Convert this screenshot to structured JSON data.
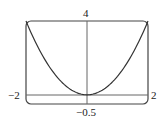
{
  "chart_data": {
    "type": "line",
    "title": "",
    "xlabel": "",
    "ylabel": "",
    "xlim": [
      -2,
      2
    ],
    "ylim": [
      -0.5,
      4
    ],
    "grid": false,
    "tick_labels": {
      "x_min": "−2",
      "x_max": "2",
      "y_min": "−0.5",
      "y_max": "4"
    },
    "series": [
      {
        "name": "y = x^2",
        "x": [
          -2,
          -1.5,
          -1,
          -0.5,
          0,
          0.5,
          1,
          1.5,
          2
        ],
        "y": [
          4,
          2.25,
          1,
          0.25,
          0,
          0.25,
          1,
          2.25,
          4
        ]
      }
    ],
    "colors": {
      "curve": "#333333",
      "axes": "#555555",
      "frame": "#444444"
    }
  }
}
